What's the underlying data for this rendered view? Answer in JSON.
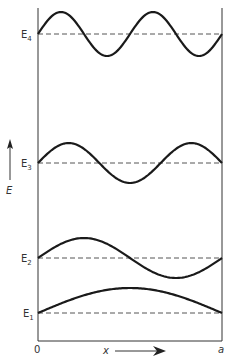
{
  "diagram": {
    "box": {
      "left_label": "0",
      "right_label": "a"
    },
    "axes": {
      "x_label": "x",
      "y_label": "E"
    },
    "levels": [
      {
        "name": "E1",
        "base": "E",
        "sub": "1",
        "n": 1
      },
      {
        "name": "E2",
        "base": "E",
        "sub": "2",
        "n": 2
      },
      {
        "name": "E3",
        "base": "E",
        "sub": "3",
        "n": 3
      },
      {
        "name": "E4",
        "base": "E",
        "sub": "4",
        "n": 4
      }
    ],
    "colors": {
      "line": "#1a1a1a",
      "dash": "#555555",
      "text": "#333333"
    }
  }
}
